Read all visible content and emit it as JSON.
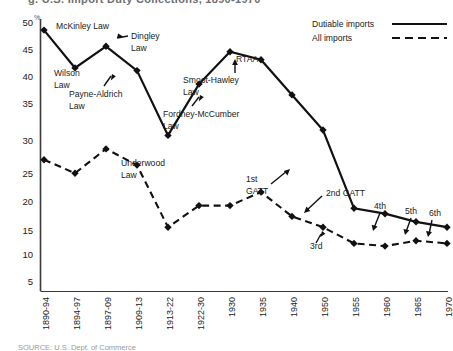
{
  "header": {
    "title_visible_fragment": "g. U.S. Import Duty Collections, 1890-1970"
  },
  "footer": {
    "source_label": "SOURCE: U.S. Dept. of Commerce"
  },
  "legend": {
    "position": "top-right",
    "entries": [
      {
        "label": "Dutiable imports",
        "style": "solid",
        "color": "#000000"
      },
      {
        "label": "All imports",
        "style": "dashed",
        "color": "#000000"
      }
    ]
  },
  "axes": {
    "y_unit": "%",
    "y_ticks": [
      "50",
      "45",
      "40",
      "35",
      "30",
      "25",
      "20",
      "15",
      "10",
      "5"
    ],
    "y_min": 0,
    "y_max": 50,
    "x_ticks": [
      "1890-94",
      "1894-97",
      "1897-09",
      "1909-13",
      "1913-22",
      "1922-30",
      "1930",
      "1935",
      "1940",
      "1950",
      "1955",
      "1960",
      "1965",
      "1970"
    ]
  },
  "annotations": [
    {
      "text": "McKinley Law",
      "name": "mckinley-law"
    },
    {
      "text": "Wilson\nLaw",
      "name": "wilson-law"
    },
    {
      "text": "Dingley\nLaw",
      "name": "dingley-law"
    },
    {
      "text": "Payne-Aldrich\nLaw",
      "name": "payne-aldrich-law"
    },
    {
      "text": "Underwood\nLaw",
      "name": "underwood-law"
    },
    {
      "text": "Fordney-McCumber\nLaw",
      "name": "fordney-mccumber-law"
    },
    {
      "text": "Smoot-Hawley\nLaw",
      "name": "smoot-hawley-law"
    },
    {
      "text": "RTAA",
      "name": "rtaa"
    },
    {
      "text": "1st\nGATT",
      "name": "first-gatt"
    },
    {
      "text": "2nd GATT",
      "name": "second-gatt"
    },
    {
      "text": "3rd",
      "name": "third-gatt"
    },
    {
      "text": "4th",
      "name": "fourth-gatt"
    },
    {
      "text": "5th",
      "name": "fifth-gatt"
    },
    {
      "text": "6th",
      "name": "sixth-gatt"
    }
  ],
  "ann_text": {
    "mckinley": "McKinley Law",
    "wilson_1": "Wilson",
    "wilson_2": "Law",
    "dingley_1": "Dingley",
    "dingley_2": "Law",
    "payne_1": "Payne-Aldrich",
    "payne_2": "Law",
    "underwood_1": "Underwood",
    "underwood_2": "Law",
    "fordney_1": "Fordney-McCumber",
    "fordney_2": "Law",
    "smoot_1": "Smoot-Hawley",
    "smoot_2": "Law",
    "rtaa": "RTAA",
    "gatt1_1": "1st",
    "gatt1_2": "GATT",
    "gatt2": "2nd GATT",
    "gatt3": "3rd",
    "gatt4": "4th",
    "gatt5": "5th",
    "gatt6": "6th"
  },
  "chart_data": {
    "type": "line",
    "xlabel": "",
    "ylabel": "%",
    "ylim": [
      0,
      50
    ],
    "grid": false,
    "legend_position": "top-right",
    "categories": [
      "1890-94",
      "1894-97",
      "1897-09",
      "1909-13",
      "1913-22",
      "1922-30",
      "1930",
      "1935",
      "1940",
      "1950",
      "1955",
      "1960",
      "1965",
      "1970"
    ],
    "series": [
      {
        "name": "Dutiable imports",
        "style": "solid",
        "values": [
          48.5,
          41.5,
          45.5,
          41.0,
          29.0,
          38.5,
          44.5,
          43.0,
          36.5,
          30.0,
          15.5,
          14.5,
          13.0,
          12.0
        ]
      },
      {
        "name": "All imports",
        "style": "dashed",
        "values": [
          24.5,
          22.0,
          26.5,
          23.5,
          12.0,
          16.0,
          16.0,
          18.5,
          14.0,
          12.0,
          9.0,
          8.5,
          9.5,
          9.0
        ]
      }
    ]
  }
}
